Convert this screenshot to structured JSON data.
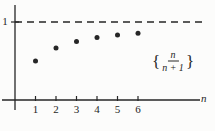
{
  "figure": {
    "background": "#fcfcfb",
    "ink": "#262626"
  },
  "chart_data": {
    "type": "scatter",
    "title": "",
    "xlabel": "n",
    "ylabel": "",
    "x": [
      1,
      2,
      3,
      4,
      5,
      6
    ],
    "values": [
      0.5,
      0.6667,
      0.75,
      0.8,
      0.8333,
      0.8571
    ],
    "x_tick_labels": [
      "1",
      "2",
      "3",
      "4",
      "5",
      "6"
    ],
    "y_tick_labels": [
      "1"
    ],
    "xlim": [
      0,
      9.3
    ],
    "ylim": [
      0,
      1.28
    ],
    "grid": false,
    "legend": "none",
    "asymptote": {
      "y": 1,
      "style": "dashed",
      "label": "1"
    },
    "annotation": {
      "open_brace": "{",
      "numerator": "n",
      "denominator": "n + 1",
      "close_brace": "}"
    }
  }
}
